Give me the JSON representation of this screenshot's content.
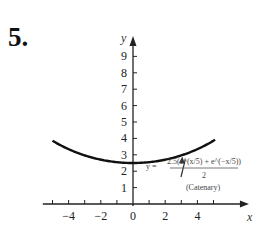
{
  "problem_number": "5.",
  "chart_data": {
    "type": "line",
    "title": "",
    "xlabel": "x",
    "ylabel": "y",
    "xlim": [
      -5.6,
      7.2
    ],
    "ylim": [
      0,
      10
    ],
    "x_ticks": [
      -5,
      -4,
      -3,
      -2,
      -1,
      1,
      2,
      3,
      4,
      5
    ],
    "x_tick_labels": [
      {
        "value": -4,
        "label": "−4"
      },
      {
        "value": -2,
        "label": "−2"
      },
      {
        "value": 0,
        "label": "0"
      },
      {
        "value": 2,
        "label": "2"
      },
      {
        "value": 4,
        "label": "4"
      }
    ],
    "y_ticks": [
      1,
      2,
      3,
      4,
      5,
      6,
      7,
      8,
      9
    ],
    "y_tick_labels": [
      "1",
      "2",
      "3",
      "4",
      "5",
      "6",
      "7",
      "8",
      "9"
    ],
    "grid": false,
    "series": [
      {
        "name": "Catenary",
        "function": "y = 2.5(e^(x/5) + e^(-x/5))/2",
        "a": 2.5,
        "domain": [
          -5.0,
          5.1
        ]
      }
    ],
    "annotation": {
      "equation_numerator": "2.5(e^(x/5) + e^(−x/5))",
      "equation_lhs": "y =",
      "equation_denominator": "2",
      "caption": "(Catenary)",
      "points_to_x": 3.0
    }
  }
}
